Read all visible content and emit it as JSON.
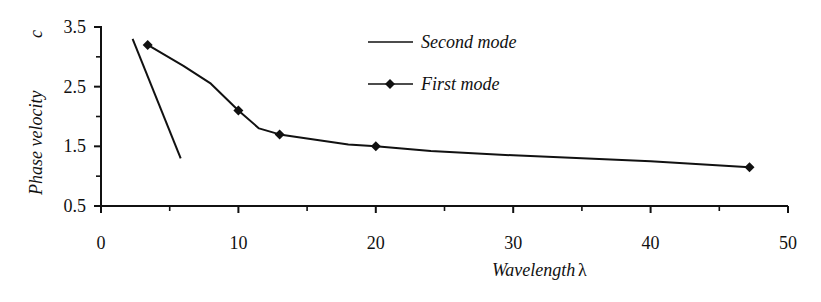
{
  "chart_data": {
    "type": "line",
    "title": "",
    "xlabel": "Wavelength",
    "xlabel_symbol": "λ",
    "ylabel": "Phase velocity",
    "ylabel_symbol": "c",
    "xlim": [
      0,
      50
    ],
    "ylim": [
      0.5,
      3.5
    ],
    "x_ticks": [
      0,
      10,
      20,
      30,
      40,
      50
    ],
    "x_tick_labels": [
      "0",
      "10",
      "20",
      "30",
      "40",
      "50"
    ],
    "x_minor_ticks": [
      5,
      15,
      25,
      35,
      45
    ],
    "y_ticks": [
      0.5,
      1.5,
      2.5,
      3.5
    ],
    "y_tick_labels": [
      "0.5",
      "1.5",
      "2.5",
      "3.5"
    ],
    "y_minor_ticks": [
      1.0,
      2.0,
      3.0
    ],
    "grid": false,
    "legend_position": "top-center",
    "series": [
      {
        "name": "Second mode",
        "marker": "none",
        "x": [
          2.3,
          5.8
        ],
        "y": [
          3.3,
          1.3
        ]
      },
      {
        "name": "First mode",
        "marker": "diamond",
        "x": [
          3.4,
          10,
          13,
          20,
          47.2
        ],
        "y": [
          3.2,
          2.1,
          1.7,
          1.5,
          1.15
        ],
        "curve_x": [
          3.4,
          6,
          8,
          10,
          11.5,
          13,
          16,
          18,
          20,
          24,
          30,
          40,
          47.2
        ],
        "curve_y": [
          3.2,
          2.85,
          2.55,
          2.1,
          1.8,
          1.7,
          1.6,
          1.53,
          1.5,
          1.42,
          1.35,
          1.25,
          1.15
        ]
      }
    ]
  },
  "legend": {
    "items": [
      {
        "label": "Second mode",
        "marker": "none"
      },
      {
        "label": "First mode",
        "marker": "diamond"
      }
    ]
  },
  "axes": {
    "x_title": "Wavelength",
    "x_symbol": "λ",
    "y_title": "Phase velocity",
    "y_symbol": "c"
  }
}
